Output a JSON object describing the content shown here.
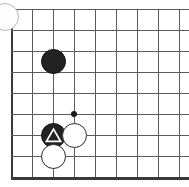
{
  "figure": {
    "board_region": "bottom-left corner",
    "background_color": "#ffffff",
    "line_color": "#5a5a5a",
    "edge_line_color": "#3a3a3a",
    "black_stone_color": "#222222",
    "white_stone_color": "#ffffff",
    "white_stone_border_color": "#2b2b2b",
    "star_point_color": "#1a1a1a",
    "artifact_color": "#b9b9b9"
  },
  "grid": {
    "spacing": 21,
    "origin_x": 11,
    "origin_y": 9,
    "columns": 9,
    "rows": 9,
    "vertical_x": [
      11,
      32,
      53,
      74,
      95,
      116,
      137,
      158,
      179
    ],
    "horizontal_y": [
      9,
      30,
      51,
      72,
      93,
      114,
      135,
      156,
      177
    ],
    "left_edge_index": 0,
    "bottom_edge_index": 8
  },
  "star_points": [
    {
      "name": "star-point-d6",
      "x": 74,
      "y": 114
    }
  ],
  "stones": [
    {
      "name": "black-stone-upper",
      "color": "black",
      "x": 53,
      "y": 61,
      "mark": "none"
    },
    {
      "name": "black-stone-marked",
      "color": "black",
      "x": 53,
      "y": 135,
      "mark": "triangle"
    },
    {
      "name": "white-stone-right",
      "color": "white",
      "x": 74,
      "y": 135,
      "mark": "none"
    },
    {
      "name": "white-stone-below",
      "color": "white",
      "x": 53,
      "y": 156,
      "mark": "none"
    }
  ],
  "artifacts": [
    {
      "name": "corner-circle-artifact",
      "x": -9,
      "y": 3,
      "size": 26
    }
  ]
}
